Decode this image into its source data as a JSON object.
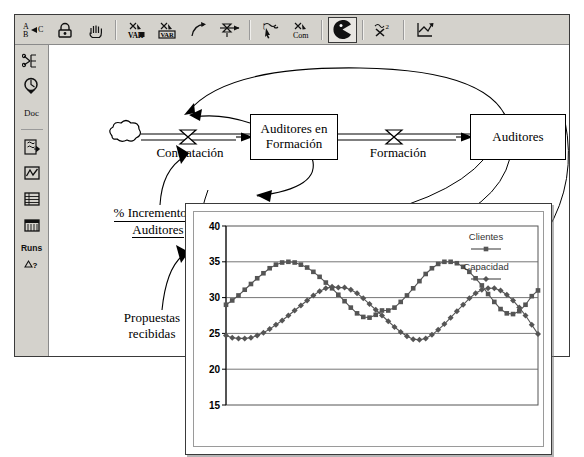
{
  "app": {
    "title": "Vensim stock-and-flow model window"
  },
  "toolbar": {
    "buttons": [
      {
        "name": "abc-text-tool",
        "label": "A B▷C",
        "icon": "abc-text-icon",
        "active": false
      },
      {
        "name": "lock-tool",
        "label": "",
        "icon": "lock-icon",
        "active": false
      },
      {
        "name": "hand-move-tool",
        "label": "",
        "icon": "hand-icon",
        "active": false
      },
      {
        "name": "variable-tool",
        "label": "VAR",
        "icon": "variable-icon",
        "active": false
      },
      {
        "name": "box-variable-tool",
        "label": "VAR",
        "icon": "box-variable-icon",
        "active": false
      },
      {
        "name": "arrow-tool",
        "label": "",
        "icon": "curved-arrow-icon",
        "active": false
      },
      {
        "name": "rate-flow-tool",
        "label": "",
        "icon": "rate-valve-icon",
        "active": false
      },
      {
        "name": "shadow-variable-tool",
        "label": "",
        "icon": "shadow-variable-icon",
        "active": false
      },
      {
        "name": "comment-tool",
        "label": "Com",
        "icon": "comment-icon",
        "active": false
      },
      {
        "name": "delete-tool",
        "label": "",
        "icon": "pacman-delete-icon",
        "active": true
      },
      {
        "name": "equation-tool",
        "label": "",
        "icon": "equation-icon",
        "active": false
      },
      {
        "name": "reference-modes-tool",
        "label": "",
        "icon": "sketch-graph-icon",
        "active": false
      }
    ],
    "separators_after": [
      2,
      6,
      7,
      8,
      9,
      10
    ]
  },
  "sidebar": {
    "items": [
      {
        "name": "sidebar-item-causes-tree",
        "label": "",
        "icon": "causes-tree-icon"
      },
      {
        "name": "sidebar-item-uses",
        "label": "",
        "icon": "uses-magnifier-icon"
      },
      {
        "name": "sidebar-item-document",
        "label": "Doc",
        "icon": "doc-icon"
      },
      {
        "name": "sidebar-item-causes-strip",
        "label": "",
        "icon": "causes-strip-icon"
      },
      {
        "name": "sidebar-item-graph",
        "label": "",
        "icon": "graph-icon"
      },
      {
        "name": "sidebar-item-table",
        "label": "",
        "icon": "table-icon"
      },
      {
        "name": "sidebar-item-table-time",
        "label": "",
        "icon": "table-time-icon"
      },
      {
        "name": "sidebar-item-runs-compare",
        "label": "Runs",
        "icon": "runs-compare-icon"
      }
    ],
    "separator_after_index": 2
  },
  "diagram": {
    "stocks": [
      {
        "name": "stock-auditores-en-formacion",
        "label": "Auditores en\nFormación"
      },
      {
        "name": "stock-auditores",
        "label": "Auditores"
      }
    ],
    "flows": [
      {
        "name": "flow-contratacion",
        "label": "Contratación"
      },
      {
        "name": "flow-formacion",
        "label": "Formación"
      }
    ],
    "auxiliaries": [
      {
        "name": "aux-porcentaje-incremento-auditores",
        "line1": "% Incremento de",
        "line2": "Auditores",
        "underlined": true
      },
      {
        "name": "aux-propuestas-recibidas",
        "line1": "Propuestas",
        "line2": "recibidas",
        "underlined": false
      }
    ]
  },
  "chart_data": {
    "type": "line",
    "title": "",
    "xlabel": "",
    "ylabel": "",
    "ylim": [
      15,
      40
    ],
    "yticks": [
      40,
      35,
      30,
      25,
      20,
      15
    ],
    "xlim": [
      0,
      47
    ],
    "xticks": [],
    "grid": true,
    "legend_position": "top-right",
    "series": [
      {
        "name": "Clientes",
        "marker": "square",
        "color": "#555555",
        "values": [
          29.0,
          29.6,
          30.3,
          31.1,
          31.9,
          32.7,
          33.4,
          34.1,
          34.6,
          34.9,
          35.0,
          34.9,
          34.6,
          34.2,
          33.6,
          32.9,
          32.1,
          31.3,
          30.4,
          29.5,
          28.6,
          27.8,
          27.3,
          27.2,
          27.6,
          28.2,
          28.2,
          28.6,
          29.4,
          30.3,
          31.3,
          32.3,
          33.3,
          34.1,
          34.7,
          35.0,
          35.0,
          34.8,
          34.3,
          33.6,
          32.7,
          31.7,
          30.5,
          29.4,
          28.4,
          27.8,
          27.7,
          28.1,
          29.0,
          30.2,
          31.0
        ]
      },
      {
        "name": "Capacidad",
        "marker": "diamond",
        "color": "#555555",
        "values": [
          24.7,
          24.4,
          24.3,
          24.3,
          24.4,
          24.7,
          25.1,
          25.6,
          26.2,
          26.8,
          27.5,
          28.2,
          28.9,
          29.6,
          30.3,
          30.9,
          31.3,
          31.5,
          31.4,
          31.4,
          31.1,
          30.6,
          29.9,
          29.1,
          28.3,
          27.5,
          26.7,
          25.9,
          25.2,
          24.6,
          24.2,
          24.1,
          24.3,
          24.8,
          25.5,
          26.3,
          27.2,
          28.1,
          29.0,
          29.9,
          30.6,
          31.1,
          31.3,
          31.3,
          31.0,
          30.4,
          29.6,
          28.6,
          27.5,
          26.2,
          24.9
        ]
      }
    ]
  }
}
